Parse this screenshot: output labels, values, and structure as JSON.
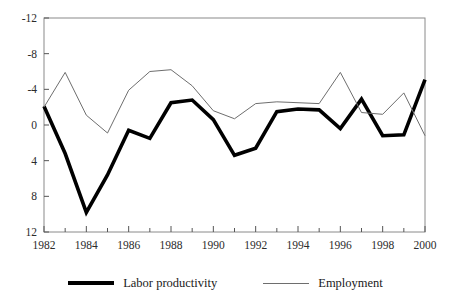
{
  "chart_data": {
    "type": "line",
    "title": "",
    "xlabel": "",
    "ylabel": "",
    "x": [
      1982,
      1983,
      1984,
      1985,
      1986,
      1987,
      1988,
      1989,
      1990,
      1991,
      1992,
      1993,
      1994,
      1995,
      1996,
      1997,
      1998,
      1999,
      2000
    ],
    "xlim": [
      1982,
      2000
    ],
    "ylim": [
      -12,
      12
    ],
    "yticks": [
      -12,
      -8,
      -4,
      0,
      4,
      8,
      12
    ],
    "xticks": [
      1982,
      1984,
      1986,
      1988,
      1990,
      1992,
      1994,
      1996,
      1998,
      2000
    ],
    "xtick_labels": [
      "1982",
      "1984",
      "1986",
      "1988",
      "1990",
      "1992",
      "1994",
      "1996",
      "1998",
      "2000"
    ],
    "ytick_labels": [
      "12",
      "8",
      "4",
      "0",
      "-4",
      "-8",
      "-12"
    ],
    "grid": false,
    "legend_position": "bottom",
    "series": [
      {
        "name": "Labor productivity",
        "color": "#000000",
        "width": 3.6,
        "values": [
          2.1,
          -3.2,
          -9.8,
          -5.6,
          -0.6,
          -1.5,
          2.5,
          2.8,
          0.6,
          -3.4,
          -2.6,
          1.5,
          1.8,
          1.7,
          -0.4,
          2.9,
          -1.2,
          -1.1,
          5.1
        ]
      },
      {
        "name": "Employment",
        "color": "#6e6e6e",
        "width": 1.0,
        "values": [
          2.0,
          5.9,
          1.1,
          -0.9,
          3.9,
          6.0,
          6.2,
          4.4,
          1.6,
          0.7,
          2.4,
          2.6,
          2.5,
          2.4,
          5.9,
          1.4,
          1.2,
          3.6,
          -1.2
        ]
      }
    ]
  },
  "legend": {
    "entries": [
      {
        "label": "Labor productivity",
        "style": "thick-black"
      },
      {
        "label": "Employment",
        "style": "thin-gray"
      }
    ]
  }
}
